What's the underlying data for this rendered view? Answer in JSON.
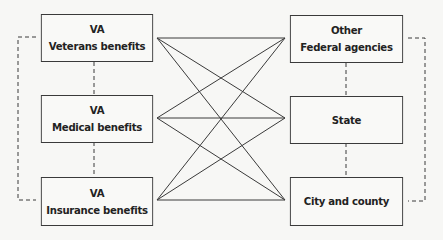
{
  "diagram": {
    "left_boxes": [
      {
        "line1": "VA",
        "line2": "Veterans benefits"
      },
      {
        "line1": "VA",
        "line2": "Medical benefits"
      },
      {
        "line1": "VA",
        "line2": "Insurance benefits"
      }
    ],
    "right_boxes": [
      {
        "line1": "Other",
        "line2": "Federal agencies"
      },
      {
        "line1": "State",
        "line2": ""
      },
      {
        "line1": "City and county",
        "line2": ""
      }
    ],
    "connections": "every left box connected to every right box by solid lines; boxes within each column connected by dashed lines",
    "colors": {
      "line": "#3a3a3a",
      "background": "#f7f7f5"
    }
  }
}
